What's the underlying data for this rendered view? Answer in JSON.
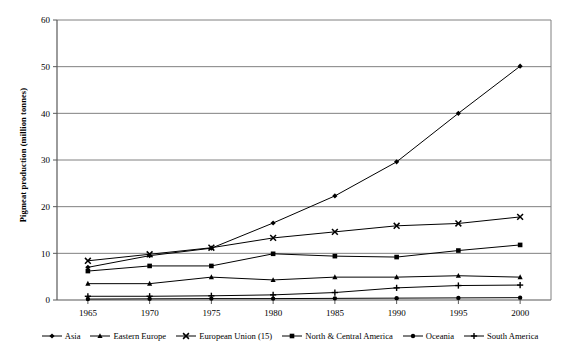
{
  "chart_data": {
    "type": "line",
    "title": "",
    "xlabel": "",
    "ylabel": "Pigmeat production (million tonnes)",
    "x": [
      1965,
      1970,
      1975,
      1980,
      1985,
      1990,
      1995,
      2000
    ],
    "xtick_labels": [
      "1965",
      "1970",
      "1975",
      "1980",
      "1985",
      "1990",
      "1995",
      "2000"
    ],
    "ytick_labels": [
      "0",
      "10",
      "20",
      "30",
      "40",
      "50",
      "60"
    ],
    "xlim": [
      1962.5,
      2002.5
    ],
    "ylim": [
      0,
      60
    ],
    "yticks": [
      0,
      10,
      20,
      30,
      40,
      50,
      60
    ],
    "grid": "horizontal",
    "legend_position": "bottom",
    "series": [
      {
        "name": "Asia",
        "marker": "diamond",
        "values": [
          7.0,
          9.5,
          11.1,
          16.5,
          22.3,
          29.6,
          40.0,
          50.1
        ]
      },
      {
        "name": "Eastern Europe",
        "marker": "triangle",
        "values": [
          3.5,
          3.5,
          4.9,
          4.3,
          4.9,
          4.9,
          5.2,
          4.9
        ]
      },
      {
        "name": "European Union (15)",
        "marker": "cross-x",
        "values": [
          8.4,
          9.8,
          11.2,
          13.3,
          14.6,
          15.9,
          16.4,
          17.8
        ]
      },
      {
        "name": "North & Central America",
        "marker": "square",
        "values": [
          6.2,
          7.3,
          7.3,
          9.9,
          9.4,
          9.2,
          10.6,
          11.8
        ]
      },
      {
        "name": "Oceania",
        "marker": "circle",
        "values": [
          0.2,
          0.25,
          0.3,
          0.3,
          0.35,
          0.4,
          0.45,
          0.5
        ]
      },
      {
        "name": "South America",
        "marker": "plus",
        "values": [
          0.8,
          0.8,
          0.9,
          1.1,
          1.6,
          2.6,
          3.1,
          3.2
        ]
      }
    ]
  },
  "legend": {
    "items": [
      {
        "label": "Asia"
      },
      {
        "label": "Eastern Europe"
      },
      {
        "label": "European Union (15)"
      },
      {
        "label": "North & Central America"
      },
      {
        "label": "Oceania"
      },
      {
        "label": "South America"
      }
    ]
  },
  "colors": {
    "line": "#000000",
    "grid": "#808080",
    "axis": "#595959",
    "background": "#ffffff"
  }
}
